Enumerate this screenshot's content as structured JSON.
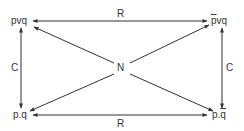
{
  "diagram": {
    "nodes": {
      "top_left": {
        "label": "pvq"
      },
      "top_right": {
        "label_neg": "p",
        "label_rest": "vq"
      },
      "bottom_left": {
        "label": "p.q"
      },
      "bottom_right": {
        "label": "p.",
        "label_neg": "q"
      },
      "center": {
        "label": "N"
      }
    },
    "edges": {
      "top": {
        "label": "R"
      },
      "bottom": {
        "label": "R"
      },
      "left": {
        "label": "C"
      },
      "right": {
        "label": "C"
      }
    },
    "colors": {
      "line": "#333333",
      "text": "#333333",
      "background": "#ffffff"
    }
  }
}
